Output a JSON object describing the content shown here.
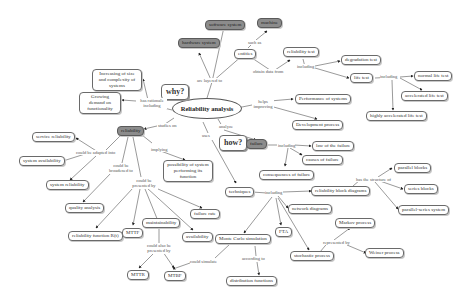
{
  "diagram": {
    "central": "Reliability analysis",
    "nodes": {
      "software_system": "software system",
      "machine": "machine",
      "hardware_system": "hardware system",
      "entities": "entities",
      "reliability_test": "reliability test",
      "degradation_test": "degradation test",
      "life_test": "life test",
      "normal_life_test": "normal life test",
      "accelerated_life_test": "accelerated life test",
      "highly_accelerated_life_test": "highly accelerated life test",
      "increasing_size": "Increasing of size and complexity of systems",
      "growing_demand": "Growing demand on functionality",
      "why": "why?",
      "performance": "Performance of systems",
      "development_process": "Development process",
      "how": "how?",
      "failure": "failure",
      "law_of_failure": "law of the failure",
      "causes_of_failure": "causes of failure",
      "consequences_of_failure": "consequences of failure",
      "reliability": "reliability",
      "service_reliability": "service reliability",
      "system_availability": "system availability",
      "system_reliability": "system reliability",
      "possibility": "possibility of system performing its function",
      "quality_analysis": "quality analysis",
      "failure_rate": "failure rate",
      "maintainability": "maintainability",
      "reliability_function": "reliability function R(t)",
      "mttf": "MTTF",
      "availability": "availability",
      "mttr": "MTTR",
      "mtbf": "MTBF",
      "techniques": "techniques",
      "reliability_block_diagrams": "reliability block diagrams",
      "parallel_blocks": "parallel blocks",
      "series_blocks": "series blocks",
      "parallel_series": "parallel-series system",
      "network_diagrams": "network diagrams",
      "fta": "FTA",
      "monte_carlo": "Monte Carlo simulation",
      "distribution_functions": "distribution functions",
      "stochastic_process": "stochastic process",
      "markov_process": "Markov process",
      "weiner_process": "Weiner process"
    },
    "links": {
      "are_layered_to": "are layered to",
      "such_as": "such as",
      "obtain_data_from": "obtain data from",
      "including_rt": "including",
      "including_lt": "including",
      "has_rationale": "has rationale including",
      "helps_improving": "helps improving",
      "analyze": "analyze",
      "uses": "uses",
      "studies_on": "studies on",
      "including_failure": "including",
      "could_be_adapted_into": "could be adapted into",
      "implying": "implying",
      "could_be_broadened_to": "could be broadened to",
      "could_be_presented_by": "could be presented by",
      "could_also_be_presented_by": "could also be presented by",
      "could_simulate": "could simulate",
      "including_tech": "including",
      "has_the_structure_of": "has the structure of",
      "according_to": "according to",
      "represented_by": "represented by"
    }
  }
}
